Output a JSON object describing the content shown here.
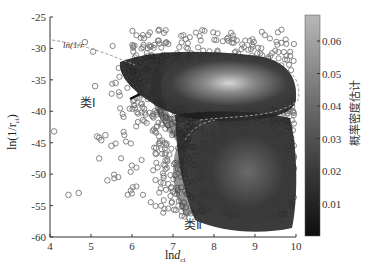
{
  "chart_data": {
    "type": "scatter",
    "title": "",
    "xlabel": "lnd_ci",
    "ylabel": "ln(1/r_ci)",
    "xlim": [
      4,
      10
    ],
    "ylim": [
      -60,
      -25
    ],
    "xticks": [
      4,
      5,
      6,
      7,
      8,
      9,
      10
    ],
    "yticks": [
      -25,
      -30,
      -35,
      -40,
      -45,
      -50,
      -55,
      -60
    ],
    "grid": false,
    "colorbar": {
      "label": "概率密度估计",
      "range": [
        0,
        0.068
      ],
      "ticks": [
        0.01,
        0.02,
        0.03,
        0.04,
        0.05,
        0.06
      ],
      "colormap": "gray"
    },
    "annotations": [
      {
        "text": "类Ⅰ",
        "x": 5.9,
        "y": -39.5
      },
      {
        "text": "类Ⅱ",
        "x": 7.6,
        "y": -58.3
      },
      {
        "text": "ln(1/r_ci)=...",
        "x": 5.2,
        "y": -30.5,
        "note": "dashed boundary line label, partially obscured"
      }
    ],
    "clusters": [
      {
        "name": "类Ⅰ",
        "center": [
          8.8,
          -37.5
        ],
        "description": "upper dense cluster, peak density ~0.065"
      },
      {
        "name": "类Ⅱ",
        "center": [
          9.0,
          -48
        ],
        "description": "lower dense cluster"
      }
    ],
    "outliers": [
      [
        4.1,
        -43.2
      ],
      [
        4.45,
        -53.3
      ],
      [
        4.7,
        -53
      ],
      [
        5.15,
        -44
      ],
      [
        5.2,
        -44.2
      ],
      [
        5.25,
        -44.6
      ],
      [
        5.35,
        -43.8
      ],
      [
        5.2,
        -47.5
      ],
      [
        5.4,
        -51
      ],
      [
        5.5,
        -45.5
      ],
      [
        4.85,
        -29
      ],
      [
        5.05,
        -30.5
      ],
      [
        5.1,
        -36
      ],
      [
        5.6,
        -35.5
      ],
      [
        5.7,
        -37.5
      ]
    ]
  },
  "labels": {
    "xlabel_main": "ln",
    "xlabel_italic": "d",
    "xlabel_sub": "ci",
    "ylabel_text": "ln(1/r",
    "ylabel_sub": "ci",
    "ylabel_close": ")",
    "class1": "类Ⅰ",
    "class2": "类Ⅱ",
    "boundary_label": "ln(1/r",
    "colorbar_label": "概率密度估计"
  }
}
